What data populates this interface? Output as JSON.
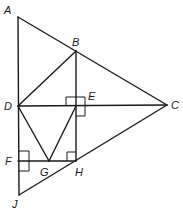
{
  "diagram": {
    "type": "geometry-figure",
    "points": {
      "A": {
        "label": "A",
        "x": 18,
        "y": 17,
        "lx": 4,
        "ly": 14
      },
      "B": {
        "label": "B",
        "x": 76,
        "y": 51,
        "lx": 72,
        "ly": 46
      },
      "C": {
        "label": "C",
        "x": 167,
        "y": 105,
        "lx": 171,
        "ly": 109
      },
      "D": {
        "label": "D",
        "x": 18,
        "y": 106,
        "lx": 4,
        "ly": 110
      },
      "E": {
        "label": "E",
        "x": 76,
        "y": 106,
        "lx": 88,
        "ly": 100
      },
      "F": {
        "label": "F",
        "x": 18,
        "y": 161,
        "lx": 5,
        "ly": 165
      },
      "G": {
        "label": "G",
        "x": 49,
        "y": 161,
        "lx": 40,
        "ly": 176
      },
      "H": {
        "label": "H",
        "x": 76,
        "y": 161,
        "lx": 75,
        "ly": 176
      },
      "J": {
        "label": "J",
        "x": 19,
        "y": 195,
        "lx": 12,
        "ly": 208
      }
    },
    "segments": [
      [
        "A",
        "C"
      ],
      [
        "A",
        "J"
      ],
      [
        "J",
        "C"
      ],
      [
        "B",
        "D"
      ],
      [
        "B",
        "H"
      ],
      [
        "D",
        "C"
      ],
      [
        "D",
        "G"
      ],
      [
        "G",
        "E"
      ],
      [
        "F",
        "H"
      ]
    ],
    "right_angles": [
      {
        "at": "E",
        "note": "perpendicular marks at E (BH ⟂ DC)"
      },
      {
        "at": "H",
        "note": "right angle at H between BH and FH"
      },
      {
        "at": "F",
        "note": "right angle at F between AJ and FH"
      }
    ]
  }
}
